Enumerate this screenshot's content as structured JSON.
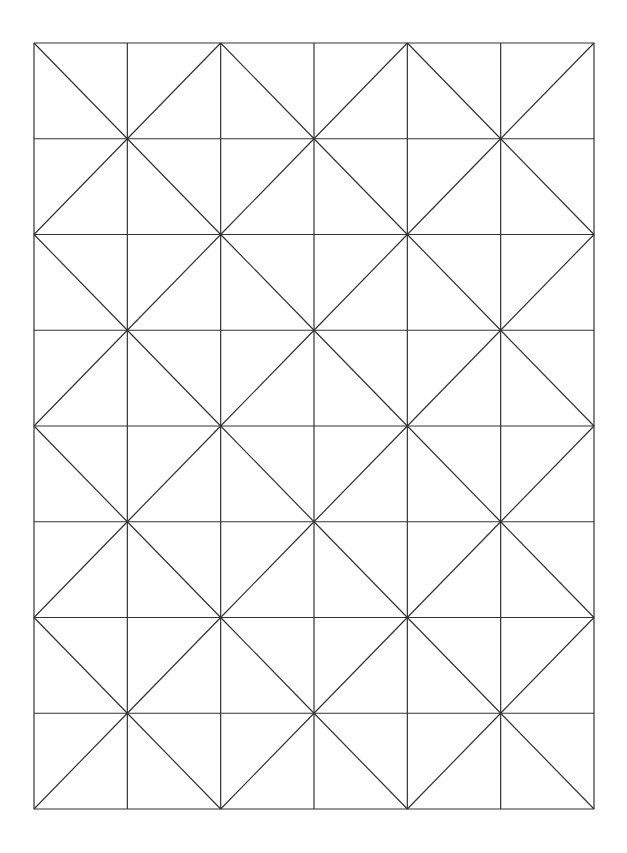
{
  "diagram": {
    "type": "triangle-grid-pattern",
    "columns": 6,
    "rows": 8,
    "bounds": {
      "x": 34,
      "y": 43,
      "width": 560,
      "height": 766
    },
    "stroke_color": "#333333",
    "background_color": "#ffffff",
    "diagonal_rule": "each cell has one diagonal connecting the two corners whose (col+row) vertex index sum is even"
  }
}
